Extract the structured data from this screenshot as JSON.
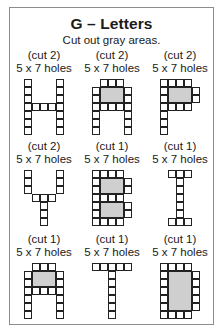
{
  "header": {
    "title": "G – Letters",
    "subtitle": "Cut out gray areas."
  },
  "letters": [
    {
      "letter": "H",
      "cut": "(cut 2)",
      "holes": "5 x 7 holes",
      "grid": [
        "10001",
        "10001",
        "10001",
        "11111",
        "10001",
        "10001",
        "10001"
      ],
      "gray": []
    },
    {
      "letter": "A",
      "cut": "(cut 2)",
      "holes": "5 x 7 holes",
      "grid": [
        "01110",
        "1ggg1",
        "1ggg1",
        "11111",
        "10001",
        "10001",
        "10001"
      ],
      "gray": [
        {
          "col": 1,
          "row": 1,
          "w": 3,
          "h": 2
        }
      ]
    },
    {
      "letter": "P",
      "cut": "(cut 2)",
      "holes": "5 x 7 holes",
      "grid": [
        "11110",
        "1ggg1",
        "1ggg1",
        "11110",
        "10000",
        "10000",
        "10000"
      ],
      "gray": [
        {
          "col": 1,
          "row": 1,
          "w": 3,
          "h": 2
        }
      ]
    },
    {
      "letter": "Y",
      "cut": "(cut 2)",
      "holes": "5 x 7 holes",
      "grid": [
        "10001",
        "10001",
        "10001",
        "01110",
        "00100",
        "00100",
        "00100"
      ],
      "gray": []
    },
    {
      "letter": "B",
      "cut": "(cut 1)",
      "holes": "5 x 7 holes",
      "grid": [
        "11110",
        "1ggg1",
        "1ggg1",
        "11110",
        "1ggg1",
        "1ggg1",
        "11110"
      ],
      "gray": [
        {
          "col": 1,
          "row": 1,
          "w": 3,
          "h": 2
        },
        {
          "col": 1,
          "row": 4,
          "w": 3,
          "h": 2
        }
      ]
    },
    {
      "letter": "I",
      "cut": "(cut 1)",
      "holes": "5 x 7 holes",
      "grid": [
        "01110",
        "00100",
        "00100",
        "00100",
        "00100",
        "00100",
        "01110"
      ],
      "gray": []
    },
    {
      "letter": "A",
      "cut": "(cut 1)",
      "holes": "5 x 7 holes",
      "grid": [
        "01110",
        "1ggg1",
        "1ggg1",
        "11111",
        "10001",
        "10001",
        "10001"
      ],
      "gray": [
        {
          "col": 1,
          "row": 1,
          "w": 3,
          "h": 2
        }
      ]
    },
    {
      "letter": "T",
      "cut": "(cut 1)",
      "holes": "5 x 7 holes",
      "grid": [
        "11111",
        "00100",
        "00100",
        "00100",
        "00100",
        "00100",
        "00100"
      ],
      "gray": []
    },
    {
      "letter": "D",
      "cut": "(cut 1)",
      "holes": "5 x 7 holes",
      "grid": [
        "11110",
        "1ggg1",
        "1ggg1",
        "1ggg1",
        "1ggg1",
        "1ggg1",
        "11110"
      ],
      "gray": [
        {
          "col": 1,
          "row": 1,
          "w": 3,
          "h": 5
        }
      ]
    }
  ],
  "colors": {
    "gray_cutout": "#cfcfcf",
    "grid_line": "#222222",
    "border": "#8c8c8c"
  }
}
